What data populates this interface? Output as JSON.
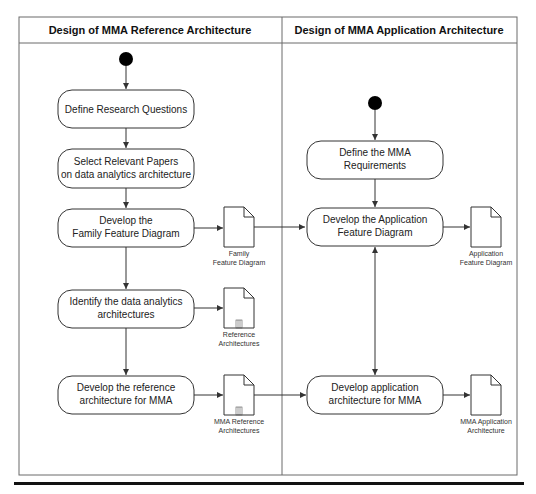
{
  "diagram": {
    "type": "uml-activity-swimlane",
    "lanes": [
      {
        "id": "lane-reference",
        "title": "Design of MMA Reference Architecture"
      },
      {
        "id": "lane-application",
        "title": "Design of MMA Application Architecture"
      }
    ],
    "nodes": {
      "define_research_questions": {
        "lines": [
          "Define Research Questions"
        ]
      },
      "select_relevant_papers": {
        "lines": [
          "Select Relevant Papers",
          "on data analytics architecture"
        ]
      },
      "develop_family_feature": {
        "lines": [
          "Develop the",
          "Family Feature Diagram"
        ]
      },
      "identify_architectures": {
        "lines": [
          "Identify the data analytics",
          "architectures"
        ]
      },
      "develop_reference_arch": {
        "lines": [
          "Develop the reference",
          "architecture for MMA"
        ]
      },
      "define_mma_requirements": {
        "lines": [
          "Define the MMA",
          "Requirements"
        ]
      },
      "develop_app_feature": {
        "lines": [
          "Develop the Application",
          "Feature Diagram"
        ]
      },
      "develop_app_arch": {
        "lines": [
          "Develop application",
          "architecture for MMA"
        ]
      }
    },
    "artifacts": {
      "family_feature_diagram": {
        "lines": [
          "Family",
          "Feature Diagram"
        ]
      },
      "reference_architectures": {
        "lines": [
          "Reference",
          "Architectures"
        ]
      },
      "mma_reference_architectures": {
        "lines": [
          "MMA Reference",
          "Architectures"
        ]
      },
      "application_feature_diagram": {
        "lines": [
          "Application",
          "Feature Diagram"
        ]
      },
      "mma_application_architecture": {
        "lines": [
          "MMA Application",
          "Architecture"
        ]
      }
    },
    "colors": {
      "stroke": "#333333",
      "frame": "#6a6a6a",
      "start_node": "#000000",
      "bottom_rule": "#111111"
    }
  }
}
